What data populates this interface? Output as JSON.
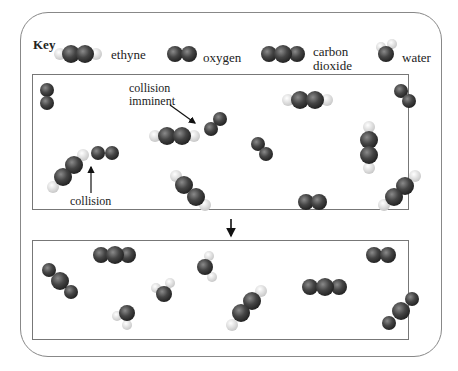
{
  "key": {
    "title": "Key",
    "items": [
      {
        "molecule": "ethyne",
        "label": "ethyne"
      },
      {
        "molecule": "oxygen",
        "label": "oxygen"
      },
      {
        "molecule": "carbon-dioxide",
        "label_line1": "carbon",
        "label_line2": "dioxide"
      },
      {
        "molecule": "water",
        "label": "water"
      }
    ]
  },
  "before_panel": {
    "annotations": {
      "collision_imminent_line1": "collision",
      "collision_imminent_line2": "imminent",
      "collision": "collision"
    },
    "molecules": [
      "oxygen",
      "ethyne",
      "oxygen",
      "oxygen",
      "ethyne",
      "oxygen",
      "oxygen",
      "ethyne",
      "ethyne",
      "oxygen",
      "ethyne",
      "oxygen",
      "ethyne"
    ]
  },
  "after_panel": {
    "molecules": [
      "carbon-dioxide",
      "carbon-dioxide",
      "water",
      "water",
      "water",
      "ethyne",
      "carbon-dioxide",
      "oxygen",
      "carbon-dioxide"
    ]
  },
  "colors": {
    "atom_dark": "#3a3a3a",
    "atom_h": "#dcdcdc",
    "border": "#777777"
  }
}
